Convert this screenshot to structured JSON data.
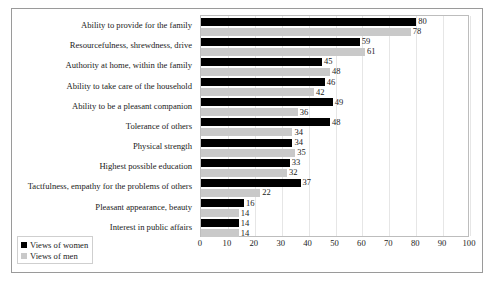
{
  "chart_data": {
    "type": "bar",
    "orientation": "horizontal",
    "title": "",
    "subtitle": "",
    "xlabel": "",
    "ylabel": "",
    "xlim": [
      0,
      100
    ],
    "xticks": [
      0,
      10,
      20,
      30,
      40,
      50,
      60,
      70,
      80,
      90,
      100
    ],
    "grid": true,
    "grid_axis": "x",
    "legend_position": "bottom-left",
    "categories": [
      "Ability to provide for the family",
      "Resourcefulness, shrewdness, drive",
      "Authority at home, within the family",
      "Ability to take care of  the household",
      "Ability to be a pleasant companion",
      "Tolerance of others",
      "Physical strength",
      "Highest possible education",
      "Tactfulness, empathy for the problems of others",
      "Pleasant appearance, beauty",
      "Interest in public affairs"
    ],
    "series": [
      {
        "name": "Views of women",
        "color": "#000000",
        "values": [
          80,
          59,
          45,
          46,
          49,
          48,
          34,
          33,
          37,
          16,
          14
        ]
      },
      {
        "name": "Views of men",
        "color": "#c9c9c9",
        "values": [
          78,
          61,
          48,
          42,
          36,
          34,
          35,
          32,
          22,
          14,
          14
        ]
      }
    ]
  },
  "legend": {
    "items": [
      {
        "label": "Views of women",
        "color": "#000000"
      },
      {
        "label": "Views of men",
        "color": "#c9c9c9"
      }
    ]
  }
}
